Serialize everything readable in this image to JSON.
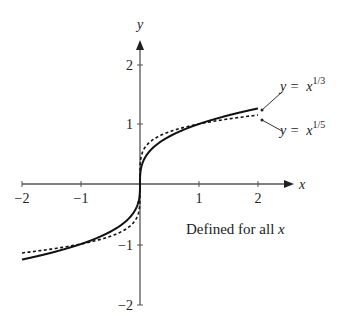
{
  "chart_data": {
    "type": "line",
    "title": "",
    "xlabel": "x",
    "ylabel": "y",
    "xlim": [
      -2,
      2
    ],
    "ylim": [
      -2,
      2
    ],
    "x_ticks": [
      "-2",
      "-1",
      "1",
      "2"
    ],
    "y_ticks": [
      "2",
      "1",
      "-1",
      "-2"
    ],
    "grid": false,
    "series": [
      {
        "name": "y = x^(1/3)",
        "style": "solid",
        "x": [
          -2,
          -1.5,
          -1,
          -0.5,
          -0.1,
          -0.01,
          0,
          0.01,
          0.1,
          0.5,
          1,
          1.5,
          2
        ],
        "y": [
          -1.26,
          -1.145,
          -1,
          -0.794,
          -0.464,
          -0.215,
          0,
          0.215,
          0.464,
          0.794,
          1,
          1.145,
          1.26
        ]
      },
      {
        "name": "y = x^(1/5)",
        "style": "dotted",
        "x": [
          -2,
          -1.5,
          -1,
          -0.5,
          -0.1,
          -0.01,
          0,
          0.01,
          0.1,
          0.5,
          1,
          1.5,
          2
        ],
        "y": [
          -1.149,
          -1.084,
          -1,
          -0.871,
          -0.631,
          -0.398,
          0,
          0.398,
          0.631,
          0.871,
          1,
          1.084,
          1.149
        ]
      }
    ],
    "annotations": [
      "Defined for all x"
    ]
  },
  "labels": {
    "x_axis": "x",
    "y_axis": "y",
    "xt_m2": "−2",
    "xt_m1": "−1",
    "xt_1": "1",
    "xt_2": "2",
    "yt_2": "2",
    "yt_1": "1",
    "yt_m1": "−1",
    "yt_m2": "−2",
    "legend_cube_base": "y =  x",
    "legend_cube_exp": "1/3",
    "legend_fifth_base": "y =  x",
    "legend_fifth_exp": "1/5",
    "note_text": "Defined for all ",
    "note_var": "x"
  },
  "colors": {
    "axis": "#555555",
    "curve": "#111111",
    "text": "#222222"
  }
}
